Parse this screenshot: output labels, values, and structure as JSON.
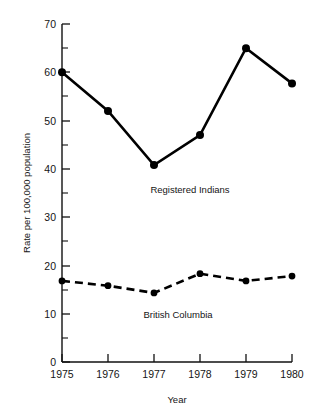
{
  "chart_data": {
    "type": "line",
    "title": "",
    "xlabel": "Year",
    "ylabel": "Rate per 100,000 population",
    "categories": [
      "1975",
      "1976",
      "1977",
      "1978",
      "1979",
      "1980"
    ],
    "x": [
      1975,
      1976,
      1977,
      1978,
      1979,
      1980
    ],
    "xlim": [
      1975,
      1980
    ],
    "ylim": [
      0,
      70
    ],
    "y_major_ticks": [
      0,
      10,
      20,
      30,
      40,
      50,
      60,
      70
    ],
    "y_minor_ticks": [
      5,
      15,
      25,
      35,
      45,
      55,
      65
    ],
    "y_tick_labels": [
      "0",
      "10",
      "20",
      "30",
      "40",
      "50",
      "60",
      "70"
    ],
    "x_tick_labels": [
      "1975",
      "1976",
      "1977",
      "1978",
      "1979",
      "1980"
    ],
    "grid": false,
    "legend_position": "inline-annotations",
    "series": [
      {
        "name": "Registered Indians",
        "style": "solid",
        "marker": "filled-circle",
        "color": "#000000",
        "values": [
          60.0,
          52.0,
          40.8,
          47.0,
          65.0,
          57.7
        ]
      },
      {
        "name": "British Columbia",
        "style": "dashed",
        "marker": "filled-circle",
        "color": "#000000",
        "values": [
          16.8,
          15.8,
          14.3,
          18.3,
          16.8,
          17.8
        ]
      }
    ],
    "annotations": [
      {
        "text": "Registered Indians",
        "x": 1977.6,
        "y": 35.0
      },
      {
        "text": "British Columbia",
        "x": 1977.5,
        "y": 9.2
      }
    ]
  },
  "axis": {
    "y_title": "Rate per 100,000 population",
    "x_title": "Year",
    "y_labels": [
      "70",
      "60",
      "50",
      "40",
      "30",
      "20",
      "10",
      "0"
    ],
    "x_labels": [
      "1975",
      "1976",
      "1977",
      "1978",
      "1979",
      "1980"
    ]
  },
  "labels": {
    "series_upper": "Registered Indians",
    "series_lower": "British Columbia"
  },
  "colors": {
    "ink": "#000000",
    "background": "#ffffff"
  }
}
